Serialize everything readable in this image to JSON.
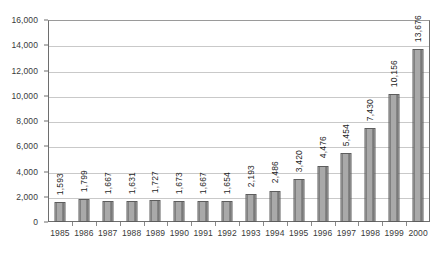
{
  "chart_data": {
    "type": "bar",
    "title": "",
    "subtitle": "",
    "xlabel": "",
    "ylabel": "",
    "categories": [
      "1985",
      "1986",
      "1987",
      "1988",
      "1989",
      "1990",
      "1991",
      "1992",
      "1993",
      "1994",
      "1995",
      "1996",
      "1997",
      "1998",
      "1999",
      "2000"
    ],
    "values": [
      1593,
      1799,
      1667,
      1631,
      1727,
      1673,
      1667,
      1654,
      2193,
      2486,
      3420,
      4476,
      5454,
      7430,
      10156,
      13676
    ],
    "data_labels": [
      "1,593",
      "1,799",
      "1,667",
      "1,631",
      "1,727",
      "1,673",
      "1,667",
      "1,654",
      "2,193",
      "2,486",
      "3,420",
      "4,476",
      "5,454",
      "7,430",
      "10,156",
      "13,676"
    ],
    "ylim": [
      0,
      16000
    ],
    "ytick_values": [
      0,
      2000,
      4000,
      6000,
      8000,
      10000,
      12000,
      14000,
      16000
    ],
    "ytick_labels": [
      "0",
      "2,000",
      "4,000",
      "6,000",
      "8,000",
      "10,000",
      "12,000",
      "14,000",
      "16,000"
    ],
    "grid": true,
    "grid_axis": "y",
    "legend": false,
    "legend_position": "none",
    "bar_color": "#a9a9a9",
    "bar_edge_color": "#5d5d5d",
    "gridline_color": "#c9c9c9",
    "axis_color": "#6e6e6e",
    "text_color": "#3a3a3a",
    "data_label_rotation": 90,
    "data_label_position": "outside-end",
    "background_color": "#ffffff"
  }
}
